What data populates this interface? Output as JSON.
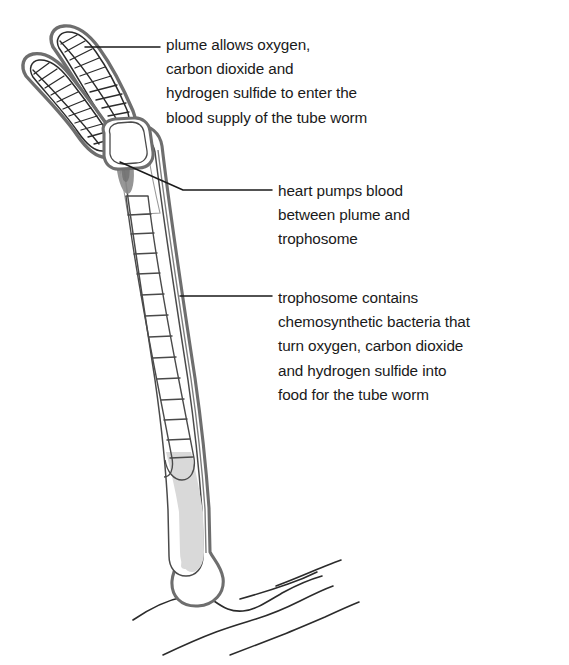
{
  "figure": {
    "background_color": "#ffffff",
    "width": 569,
    "height": 665
  },
  "colors": {
    "outline": "#5f5f5f",
    "outline_dark": "#3a3a3a",
    "body_fill": "#ffffff",
    "tube_fill": "#d9d9d9",
    "trophosome_fill": "#f2f2f2",
    "heart_fill": "#8c8c8c",
    "text": "#1a1a1a",
    "leader_line": "#1a1a1a",
    "ground_line": "#2b2b2b"
  },
  "annotations": [
    {
      "id": "plume",
      "name": "plume-label",
      "text": "plume allows oxygen,\ncarbon dioxide and\nhydrogen sulfide to enter the\nblood supply of the tube worm",
      "leader": {
        "type": "straight",
        "from": [
          85,
          47
        ],
        "to": [
          160,
          47
        ]
      }
    },
    {
      "id": "heart",
      "name": "heart-label",
      "text": "heart pumps blood\nbetween plume and\ntrophosome",
      "leader": {
        "type": "bent",
        "points": [
          [
            120,
            162
          ],
          [
            183,
            190
          ],
          [
            272,
            190
          ]
        ]
      }
    },
    {
      "id": "trophosome",
      "name": "trophosome-label",
      "text": "trophosome contains\nchemosynthetic bacteria that\nturn oxygen, carbon dioxide\nand hydrogen sulfide into\nfood for the tube worm",
      "leader": {
        "type": "straight",
        "from": [
          180,
          296
        ],
        "to": [
          272,
          296
        ]
      }
    }
  ],
  "structures": {
    "plume": {
      "label": "plume",
      "lobes": 2,
      "description": "two feathered lobes with internal hatching at the top of the worm"
    },
    "heart": {
      "label": "heart",
      "description": "dark elongated organ inside the upper tube"
    },
    "trophosome": {
      "label": "trophosome",
      "segments": 14,
      "description": "segmented ladder-like organ running down the worm body"
    },
    "tube": {
      "label": "tube",
      "description": "curved protective tube enclosing the worm"
    },
    "seafloor": {
      "label": "seafloor",
      "lines": 5,
      "description": "wavy lines representing the ocean floor at the worm base"
    }
  }
}
